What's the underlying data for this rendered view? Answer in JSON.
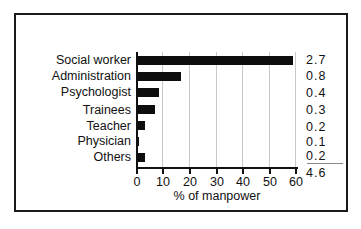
{
  "chart_data": {
    "type": "bar",
    "orientation": "horizontal",
    "title": "",
    "xlabel": "% of manpower",
    "ylabel": "",
    "xlim": [
      0,
      60
    ],
    "xticks": [
      0,
      10,
      20,
      30,
      40,
      50,
      60
    ],
    "grid": true,
    "legend": false,
    "categories": [
      "Social worker",
      "Administration",
      "Psychologist",
      "Trainees",
      "Teacher",
      "Physician",
      "Others"
    ],
    "values": [
      59,
      17,
      8.5,
      7,
      3.5,
      1,
      3.5
    ],
    "annotations": {
      "column_label": "",
      "column_values": [
        "2.7",
        "0.8",
        "0.4",
        "0.3",
        "0.2",
        "0.1",
        "0.2"
      ],
      "total": "4.6",
      "total_rule": true
    },
    "bar_color": "#0d0d0d",
    "grid_color": "#c9c9c9",
    "axis_color": "#111111"
  }
}
